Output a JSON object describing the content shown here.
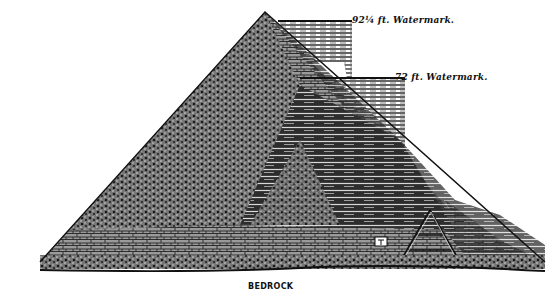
{
  "figure": {
    "labels": {
      "watermark_high": "92¼ ft. Watermark.",
      "watermark_low": "72 ft. Watermark.",
      "base": "BEDROCK"
    },
    "colors": {
      "ink": "#111111",
      "paper": "#ffffff",
      "light_stone": "#8a8a8a",
      "dark_stone": "#2a2a2a"
    }
  }
}
